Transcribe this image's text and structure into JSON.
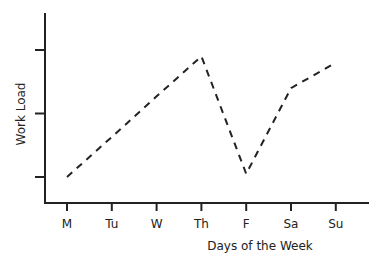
{
  "chart_data": {
    "type": "line",
    "title": "",
    "xlabel": "Days of the Week",
    "ylabel": "Work Load",
    "categories": [
      "M",
      "Tu",
      "W",
      "Th",
      "F",
      "Sa",
      "Su"
    ],
    "series": [
      {
        "name": "Work Load",
        "values": [
          1.0,
          1.63,
          2.27,
          2.9,
          1.05,
          2.4,
          2.8
        ],
        "style": "dashed",
        "color": "#222222"
      }
    ],
    "y_ticks": [
      1,
      2,
      3
    ],
    "y_tick_labels": [
      "",
      "",
      ""
    ],
    "ylim": [
      0.6,
      3.6
    ],
    "grid": false,
    "legend": "none"
  }
}
